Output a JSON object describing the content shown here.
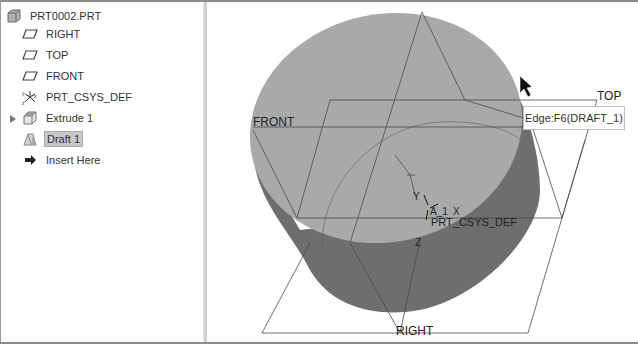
{
  "model_tree": {
    "root": {
      "label": "PRT0002.PRT",
      "icon": "part-icon"
    },
    "items": [
      {
        "label": "RIGHT",
        "icon": "datum-plane-icon"
      },
      {
        "label": "TOP",
        "icon": "datum-plane-icon"
      },
      {
        "label": "FRONT",
        "icon": "datum-plane-icon"
      },
      {
        "label": "PRT_CSYS_DEF",
        "icon": "coordinate-system-icon"
      },
      {
        "label": "Extrude 1",
        "icon": "extrude-icon",
        "expandable": true
      },
      {
        "label": "Draft 1",
        "icon": "draft-icon",
        "selected": true
      },
      {
        "label": "Insert Here",
        "icon": "insert-arrow-icon"
      }
    ]
  },
  "viewport": {
    "plane_labels": {
      "front": "FRONT",
      "top": "TOP",
      "right": "RIGHT"
    },
    "csys": {
      "name": "PRT_CSYS_DEF",
      "x": "X",
      "y": "Y",
      "z": "Z",
      "axis": "A_1"
    },
    "tooltip": "Edge:F6(DRAFT_1)",
    "colors": {
      "top_face": "#a9a9a9",
      "side_face": "#6e6e6e",
      "datum_line": "#4a4a4a"
    }
  }
}
